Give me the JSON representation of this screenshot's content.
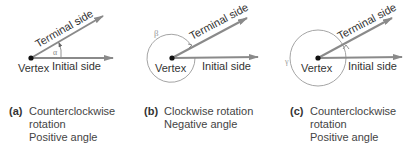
{
  "colors": {
    "ray": "#8a8a8a",
    "vertex": "#111111",
    "circle": "#9a9a9a",
    "text": "#333333",
    "greek": "#888888"
  },
  "panels": [
    {
      "id": "a",
      "vertex_label": "Vertex",
      "initial_label": "Initial side",
      "terminal_label": "Terminal side",
      "angle_symbol": "α",
      "caption_tag": "(a)",
      "caption_lines": [
        "Counterclockwise",
        "rotation",
        "Positive angle"
      ]
    },
    {
      "id": "b",
      "vertex_label": "Vertex",
      "initial_label": "Initial side",
      "terminal_label": "Terminal side",
      "angle_symbol": "β",
      "caption_tag": "(b)",
      "caption_lines": [
        "Clockwise rotation",
        "Negative angle"
      ]
    },
    {
      "id": "c",
      "vertex_label": "Vertex",
      "initial_label": "Initial side",
      "terminal_label": "Terminal side",
      "angle_symbol": "γ",
      "caption_tag": "(c)",
      "caption_lines": [
        "Counterclockwise",
        "rotation",
        "Positive angle"
      ]
    }
  ]
}
